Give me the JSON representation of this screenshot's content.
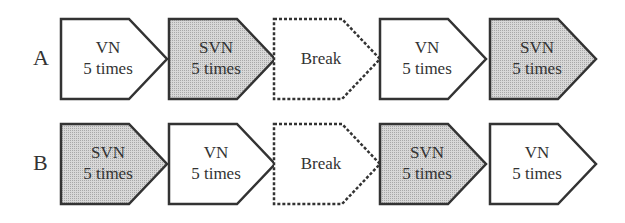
{
  "colors": {
    "stroke": "#333333",
    "fill_shaded": "#cfcfcf",
    "fill_plain": "#ffffff"
  },
  "rows": [
    {
      "label": "A",
      "steps": [
        {
          "title": "VN",
          "subtitle": "5 times",
          "style": "plain"
        },
        {
          "title": "SVN",
          "subtitle": "5 times",
          "style": "shaded"
        },
        {
          "title": "Break",
          "subtitle": "",
          "style": "dashed"
        },
        {
          "title": "VN",
          "subtitle": "5 times",
          "style": "plain"
        },
        {
          "title": "SVN",
          "subtitle": "5 times",
          "style": "shaded"
        }
      ]
    },
    {
      "label": "B",
      "steps": [
        {
          "title": "SVN",
          "subtitle": "5 times",
          "style": "shaded"
        },
        {
          "title": "VN",
          "subtitle": "5 times",
          "style": "plain"
        },
        {
          "title": "Break",
          "subtitle": "",
          "style": "dashed"
        },
        {
          "title": "SVN",
          "subtitle": "5 times",
          "style": "shaded"
        },
        {
          "title": "VN",
          "subtitle": "5 times",
          "style": "plain"
        }
      ]
    }
  ]
}
